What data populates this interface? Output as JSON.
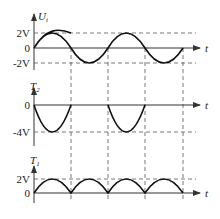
{
  "panels": [
    {
      "id": "input",
      "ylabel": "U",
      "ylabel_sub": "i",
      "xlabel": "t",
      "ticks": [
        "2V",
        "0",
        "-2V"
      ],
      "waveform": "sine",
      "amplitude_V": 2
    },
    {
      "id": "t2",
      "ylabel": "T",
      "ylabel_sub": "2",
      "xlabel": "t",
      "ticks": [
        "0",
        "-4V"
      ],
      "waveform": "negative half-wave (peak -4V)",
      "amplitude_V": -4
    },
    {
      "id": "t1",
      "ylabel": "T",
      "ylabel_sub": "1",
      "xlabel": "t",
      "ticks": [
        "2V",
        "0"
      ],
      "waveform": "full-wave rectified (peak 2V)",
      "amplitude_V": 2
    }
  ],
  "colors": {
    "wave": "#111111",
    "axis": "#333333",
    "guide": "#555555"
  }
}
